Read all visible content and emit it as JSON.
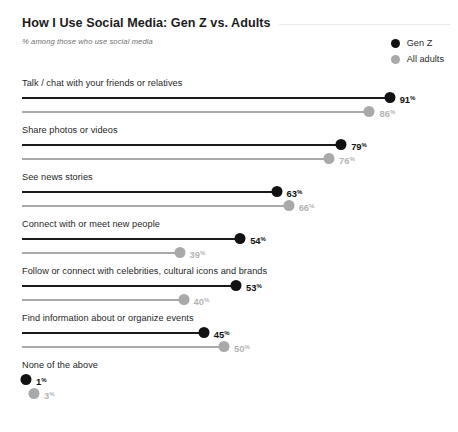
{
  "header": {
    "title": "How I Use Social Media: Gen Z vs. Adults",
    "subtitle": "% among those who use social media"
  },
  "legend": {
    "items": [
      {
        "label": "Gen Z",
        "color": "#121212",
        "icon": "circle-icon"
      },
      {
        "label": "All adults",
        "color": "#a9a9a9",
        "icon": "circle-icon"
      }
    ]
  },
  "colors": {
    "gen_z": "#121212",
    "all_adults": "#a9a9a9",
    "gen_z_label": "#111111",
    "all_adults_label": "#b4b4b4",
    "background": "#ffffff",
    "title_rule": "#e9e9e9"
  },
  "percent_symbol": "%",
  "chart_data": {
    "type": "bar",
    "title": "How I Use Social Media: Gen Z vs. Adults",
    "subtitle": "% among those who use social media",
    "xlabel": "",
    "ylabel": "",
    "xlim": [
      0,
      100
    ],
    "grid": false,
    "legend_position": "top-right",
    "orientation": "horizontal",
    "note": "Lollipop / dot-and-line chart; values are percentages",
    "categories": [
      "Talk / chat with your friends or relatives",
      "Share photos or videos",
      "See news stories",
      "Connect with or meet new people",
      "Follow or connect with celebrities, cultural icons and brands",
      "Find information about or organize events",
      "None of the above"
    ],
    "series": [
      {
        "name": "Gen Z",
        "color": "#121212",
        "values": [
          91,
          79,
          63,
          54,
          53,
          45,
          1
        ],
        "labels": [
          "91",
          "79",
          "63",
          "54",
          "53",
          "45",
          "1"
        ]
      },
      {
        "name": "All adults",
        "color": "#a9a9a9",
        "values": [
          86,
          76,
          66,
          39,
          40,
          50,
          3
        ],
        "labels": [
          "86",
          "76",
          "66",
          "39",
          "40",
          "50",
          "3"
        ]
      }
    ]
  }
}
